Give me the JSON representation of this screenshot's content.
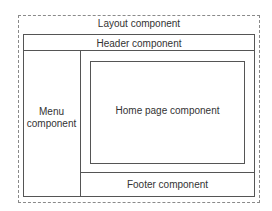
{
  "diagram": {
    "layout": {
      "label": "Layout component"
    },
    "header": {
      "label": "Header component"
    },
    "menu": {
      "label_line1": "Menu",
      "label_line2": "component"
    },
    "home": {
      "label": "Home page component"
    },
    "footer": {
      "label": "Footer component"
    }
  }
}
